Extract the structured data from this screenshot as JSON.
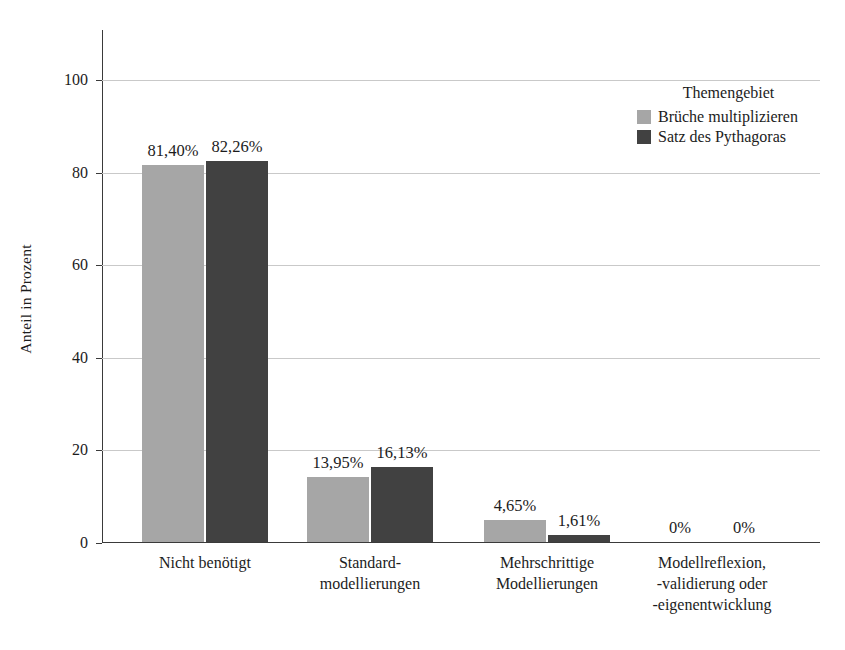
{
  "chart_data": {
    "type": "bar",
    "title": "",
    "xlabel": "",
    "ylabel": "Anteil in Prozent",
    "ylim": [
      0,
      100
    ],
    "yticks": [
      0,
      20,
      40,
      60,
      80,
      100
    ],
    "ytick_labels": [
      "0",
      "20",
      "40",
      "60",
      "80",
      "100"
    ],
    "grid": true,
    "legend_title": "Themengebiet",
    "legend_position": "upper right",
    "categories": [
      "Nicht benötigt",
      "Standard-\nmodellierungen",
      "Mehrschrittige\nModellierungen",
      "Modellreflexion,\n-validierung oder\n-eigenentwicklung"
    ],
    "category_lines": [
      [
        "Nicht benötigt"
      ],
      [
        "Standard-",
        "modellierungen"
      ],
      [
        "Mehrschrittige",
        "Modellierungen"
      ],
      [
        "Modellreflexion,",
        "-validierung oder",
        "-eigenentwicklung"
      ]
    ],
    "series": [
      {
        "name": "Brüche multiplizieren",
        "color": "#a6a6a6",
        "values": [
          81.4,
          13.95,
          4.65,
          0
        ],
        "labels": [
          "81,40%",
          "13,95%",
          "4,65%",
          "0%"
        ]
      },
      {
        "name": "Satz des Pythagoras",
        "color": "#414141",
        "values": [
          82.26,
          16.13,
          1.61,
          0
        ],
        "labels": [
          "82,26%",
          "16,13%",
          "1,61%",
          "0%"
        ]
      }
    ]
  },
  "colors": {
    "series_light": "#a6a6a6",
    "series_dark": "#414141",
    "grid": "#c9c9c9",
    "axis": "#3a3a3a",
    "text": "#1c1c1c",
    "background": "#ffffff"
  }
}
